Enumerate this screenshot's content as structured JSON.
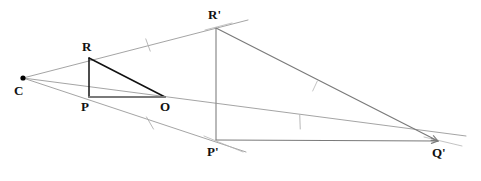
{
  "figure": {
    "kind": "geometry-diagram",
    "width": 481,
    "height": 181,
    "background_color": "#ffffff"
  },
  "colors": {
    "dark_stroke": "#111111",
    "mid_stroke": "#7a7a7a",
    "light_stroke": "#9a9a9a",
    "faint_stroke": "#b4b4b4",
    "label_color": "#111111",
    "point_fill": "#000000"
  },
  "points": [
    {
      "id": "C",
      "label": "C",
      "x": 23,
      "y": 78,
      "label_x": 14,
      "label_y": 84,
      "dot": true
    },
    {
      "id": "R",
      "label": "R",
      "x": 89,
      "y": 58,
      "label_x": 82,
      "label_y": 40,
      "dot": false
    },
    {
      "id": "P",
      "label": "P",
      "x": 89,
      "y": 97,
      "label_x": 81,
      "label_y": 100,
      "dot": false
    },
    {
      "id": "O",
      "label": "O",
      "x": 165,
      "y": 97,
      "label_x": 160,
      "label_y": 100,
      "dot": false
    },
    {
      "id": "Rp",
      "label": "R'",
      "x": 216,
      "y": 28,
      "label_x": 208,
      "label_y": 8,
      "dot": false
    },
    {
      "id": "Pp",
      "label": "P'",
      "x": 216,
      "y": 140,
      "label_x": 207,
      "label_y": 145,
      "dot": false
    },
    {
      "id": "Qp",
      "label": "Q'",
      "x": 438,
      "y": 141,
      "label_x": 432,
      "label_y": 146,
      "dot": false
    }
  ],
  "segments": [
    {
      "name": "ray-c-to-rprime",
      "x1": 23,
      "y1": 78,
      "x2": 248,
      "y2": 20,
      "color": "#9a9a9a",
      "width": 0.9
    },
    {
      "name": "ray-c-to-pprime",
      "x1": 23,
      "y1": 78,
      "x2": 246,
      "y2": 152,
      "color": "#9a9a9a",
      "width": 0.9
    },
    {
      "name": "ray-c-to-qprime",
      "x1": 23,
      "y1": 78,
      "x2": 466,
      "y2": 136,
      "color": "#9a9a9a",
      "width": 0.9
    },
    {
      "name": "segment-r-to-p",
      "x1": 89,
      "y1": 58,
      "x2": 89,
      "y2": 97,
      "color": "#111111",
      "width": 1.5
    },
    {
      "name": "segment-r-to-o",
      "x1": 89,
      "y1": 58,
      "x2": 165,
      "y2": 97,
      "color": "#111111",
      "width": 1.5
    },
    {
      "name": "segment-p-to-o",
      "x1": 89,
      "y1": 97,
      "x2": 165,
      "y2": 97,
      "color": "#7a7a7a",
      "width": 2.0
    },
    {
      "name": "segment-rprime-to-pprime",
      "x1": 216,
      "y1": 28,
      "x2": 216,
      "y2": 140,
      "color": "#8a8a8a",
      "width": 1.2
    },
    {
      "name": "segment-rprime-to-qprime",
      "x1": 216,
      "y1": 28,
      "x2": 438,
      "y2": 141,
      "color": "#7a7a7a",
      "width": 1.2
    },
    {
      "name": "segment-pprime-to-qprime",
      "x1": 216,
      "y1": 140,
      "x2": 438,
      "y2": 141,
      "color": "#7a7a7a",
      "width": 1.2
    },
    {
      "name": "tick-extension-at-rprime",
      "x1": 205,
      "y1": 30,
      "x2": 232,
      "y2": 23,
      "color": "#b4b4b4",
      "width": 0.8
    },
    {
      "name": "tick-extension-at-pprime",
      "x1": 204,
      "y1": 136,
      "x2": 243,
      "y2": 152,
      "color": "#b4b4b4",
      "width": 0.8
    },
    {
      "name": "tick-extension-at-qprime",
      "x1": 424,
      "y1": 137,
      "x2": 462,
      "y2": 146,
      "color": "#b4b4b4",
      "width": 0.8
    }
  ],
  "tick_marks": [
    {
      "name": "tick-on-c-rprime-ray",
      "cx": 148,
      "cy": 45,
      "angle": 70,
      "length": 13,
      "color": "#b0b0b0",
      "width": 0.9
    },
    {
      "name": "tick-on-c-pprime-ray",
      "cx": 150,
      "cy": 123,
      "angle": 60,
      "length": 14,
      "color": "#b0b0b0",
      "width": 0.9
    },
    {
      "name": "tick-on-c-qprime-ray",
      "cx": 300,
      "cy": 122,
      "angle": 88,
      "length": 14,
      "color": "#b0b0b0",
      "width": 0.9
    },
    {
      "name": "tick-on-rprime-qprime-edge",
      "cx": 315,
      "cy": 86,
      "angle": 115,
      "length": 11,
      "color": "#b4b4b4",
      "width": 0.8
    }
  ],
  "arrowheads": [
    {
      "name": "arrowhead-into-qprime",
      "x": 438,
      "y": 141,
      "angle": 182,
      "size": 7,
      "color": "#7a7a7a"
    },
    {
      "name": "arrowhead-into-qprime-upper",
      "x": 438,
      "y": 141,
      "angle": 207,
      "size": 7,
      "color": "#7a7a7a"
    }
  ]
}
